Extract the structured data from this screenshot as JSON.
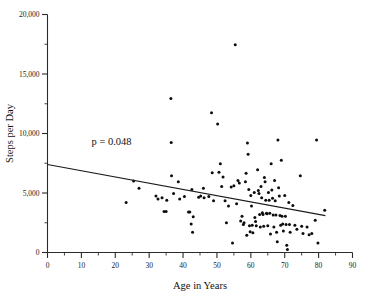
{
  "chart_data": {
    "type": "scatter",
    "title": "",
    "xlabel": "Age in Years",
    "ylabel": "Steps per Day",
    "xlim": [
      0,
      90
    ],
    "ylim": [
      0,
      20000
    ],
    "xticks": [
      0,
      10,
      20,
      30,
      40,
      50,
      60,
      70,
      80,
      90
    ],
    "xticklabels": [
      "0",
      "10",
      "20",
      "30",
      "40",
      "50",
      "60",
      "70",
      "80",
      "90"
    ],
    "xminor_step": 5,
    "yticks": [
      0,
      5000,
      10000,
      15000,
      20000
    ],
    "yticklabels": [
      "0",
      "5,000",
      "10,000",
      "15,000",
      "20,000"
    ],
    "yminor_step": 2500,
    "grid": false,
    "legend": null,
    "annotations": [
      {
        "text": "p = 0.048",
        "x": 13,
        "y": 9000
      }
    ],
    "trendline": {
      "type": "linear-regression",
      "x_start": 0,
      "y_start": 7400,
      "x_end": 82,
      "y_end": 3100,
      "slope": -52.4,
      "intercept": 7400
    },
    "marker": {
      "shape": "circle",
      "color": "#0d0d0d",
      "size": 3.0
    },
    "n_points": 124,
    "points": [
      [
        23.2,
        4200
      ],
      [
        25.4,
        6000
      ],
      [
        27.0,
        5400
      ],
      [
        32.0,
        4750
      ],
      [
        32.6,
        4500
      ],
      [
        33.8,
        4600
      ],
      [
        34.4,
        3450
      ],
      [
        35.0,
        3450
      ],
      [
        35.2,
        4400
      ],
      [
        36.4,
        12950
      ],
      [
        36.5,
        9250
      ],
      [
        36.6,
        6450
      ],
      [
        37.2,
        4950
      ],
      [
        38.6,
        5950
      ],
      [
        39.0,
        4500
      ],
      [
        40.4,
        4700
      ],
      [
        41.6,
        3400
      ],
      [
        42.0,
        3400
      ],
      [
        42.4,
        2400
      ],
      [
        42.6,
        5300
      ],
      [
        42.8,
        1700
      ],
      [
        43.0,
        3000
      ],
      [
        44.6,
        4650
      ],
      [
        45.2,
        4750
      ],
      [
        46.0,
        5400
      ],
      [
        46.2,
        4600
      ],
      [
        47.6,
        4700
      ],
      [
        48.4,
        11750
      ],
      [
        48.6,
        6700
      ],
      [
        49.0,
        4350
      ],
      [
        50.2,
        10800
      ],
      [
        50.6,
        6750
      ],
      [
        51.0,
        7450
      ],
      [
        51.4,
        5550
      ],
      [
        51.8,
        6350
      ],
      [
        52.4,
        4350
      ],
      [
        52.8,
        2500
      ],
      [
        53.4,
        3900
      ],
      [
        54.2,
        5500
      ],
      [
        54.6,
        800
      ],
      [
        55.0,
        5600
      ],
      [
        55.4,
        17450
      ],
      [
        55.8,
        4100
      ],
      [
        56.2,
        6050
      ],
      [
        56.6,
        5850
      ],
      [
        57.0,
        2650
      ],
      [
        57.4,
        3050
      ],
      [
        57.8,
        2350
      ],
      [
        58.0,
        2500
      ],
      [
        58.4,
        5950
      ],
      [
        58.6,
        6650
      ],
      [
        58.8,
        1450
      ],
      [
        59.0,
        9200
      ],
      [
        59.2,
        8250
      ],
      [
        59.4,
        5300
      ],
      [
        59.6,
        2250
      ],
      [
        59.8,
        1750
      ],
      [
        60.0,
        4800
      ],
      [
        60.2,
        3900
      ],
      [
        60.4,
        2300
      ],
      [
        60.6,
        1650
      ],
      [
        61.0,
        5050
      ],
      [
        61.2,
        2950
      ],
      [
        61.4,
        2600
      ],
      [
        61.6,
        2250
      ],
      [
        62.0,
        6950
      ],
      [
        62.2,
        5200
      ],
      [
        62.4,
        4950
      ],
      [
        62.6,
        3200
      ],
      [
        62.8,
        2150
      ],
      [
        63.0,
        5550
      ],
      [
        63.2,
        4600
      ],
      [
        63.4,
        3350
      ],
      [
        63.6,
        3200
      ],
      [
        63.8,
        2200
      ],
      [
        64.0,
        6300
      ],
      [
        64.2,
        5950
      ],
      [
        64.4,
        4400
      ],
      [
        64.6,
        3300
      ],
      [
        64.8,
        3250
      ],
      [
        65.0,
        2250
      ],
      [
        65.2,
        5050
      ],
      [
        65.4,
        4400
      ],
      [
        65.6,
        3300
      ],
      [
        65.8,
        1550
      ],
      [
        66.0,
        7450
      ],
      [
        66.2,
        5250
      ],
      [
        66.4,
        4550
      ],
      [
        66.6,
        3150
      ],
      [
        66.8,
        2150
      ],
      [
        67.0,
        6050
      ],
      [
        67.2,
        4350
      ],
      [
        67.4,
        3150
      ],
      [
        67.6,
        1700
      ],
      [
        67.8,
        900
      ],
      [
        68.0,
        9450
      ],
      [
        68.2,
        5450
      ],
      [
        68.4,
        4750
      ],
      [
        68.6,
        3100
      ],
      [
        68.8,
        2300
      ],
      [
        69.0,
        7750
      ],
      [
        69.2,
        3050
      ],
      [
        69.4,
        2400
      ],
      [
        69.6,
        1800
      ],
      [
        70.0,
        4800
      ],
      [
        70.2,
        3050
      ],
      [
        70.4,
        2350
      ],
      [
        70.6,
        600
      ],
      [
        70.8,
        250
      ],
      [
        71.2,
        4200
      ],
      [
        71.4,
        2350
      ],
      [
        71.6,
        1700
      ],
      [
        72.4,
        3950
      ],
      [
        73.0,
        2300
      ],
      [
        73.6,
        1950
      ],
      [
        74.6,
        6450
      ],
      [
        75.0,
        2200
      ],
      [
        75.4,
        1600
      ],
      [
        76.6,
        2150
      ],
      [
        77.2,
        1500
      ],
      [
        78.0,
        1600
      ],
      [
        79.0,
        2700
      ],
      [
        79.4,
        9450
      ],
      [
        79.8,
        800
      ],
      [
        81.8,
        3550
      ]
    ]
  }
}
